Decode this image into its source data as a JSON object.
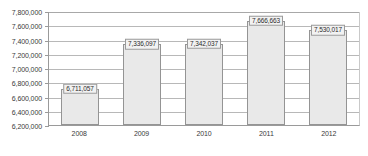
{
  "chart_data": {
    "type": "bar",
    "title": "",
    "subtitle": "",
    "xlabel": "",
    "ylabel": "",
    "categories": [
      "2008",
      "2009",
      "2010",
      "2011",
      "2012"
    ],
    "values": [
      6711057,
      7336097,
      7342037,
      7666663,
      7530017
    ],
    "data_labels": [
      "6,711,057",
      "7,336,097",
      "7,342,037",
      "7,666,663",
      "7,530,017"
    ],
    "ylim": [
      6200000,
      7800000
    ],
    "ytick_step": 200000,
    "ytick_labels": [
      "7,800,000",
      "7,600,000",
      "7,400,000",
      "7,200,000",
      "7,000,000",
      "6,800,000",
      "6,600,000",
      "6,400,000",
      "6,200,000"
    ],
    "ytick_values": [
      7800000,
      7600000,
      7400000,
      7200000,
      7000000,
      6800000,
      6600000,
      6400000,
      6200000
    ],
    "grid": "horizontal",
    "legend": "none",
    "colors": {
      "bar_fill": "#e9e9e9",
      "bar_border": "#949494",
      "gridline": "#b8b8b8",
      "axis": "#9a9a9a",
      "label_text": "#2b2b2b",
      "tick_text": "#3a3a3a",
      "label_box_fill": "#f2f2f2",
      "background": "#ffffff"
    }
  }
}
